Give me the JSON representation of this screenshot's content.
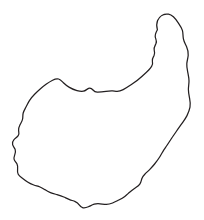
{
  "canvas": {
    "width": 204,
    "height": 220,
    "background_color": "#ffffff",
    "title": "Hand-drawn closed outline silhouette"
  },
  "drawing": {
    "name": "comma-shaped blob outline",
    "description": "Single closed hand-drawn contour: a rounded bumpy body filling the lower-left, rising into a narrow pointed hook at the upper right, with a concave notch along the top edge between the body and the hook.",
    "stroke_color": "#231f20",
    "fill_color": "none",
    "stroke_width": 1.25,
    "closed": true,
    "shape_type": "freeform-outline",
    "bounding_box": {
      "x": 12,
      "y": 13,
      "width": 179,
      "height": 196
    },
    "extrema": {
      "topmost": {
        "x": 168,
        "y": 14
      },
      "bottommost": {
        "x": 84,
        "y": 208
      },
      "leftmost": {
        "x": 12,
        "y": 141
      },
      "rightmost": {
        "x": 190,
        "y": 112
      }
    },
    "path_d": "M 168.5 14.2 C 163.6 13.4 159.4 16.2 157.6 20.6 C 156.2 24.0 156.6 26.8 157.4 29.8 C 155.8 32.6 154.6 35.0 155.4 37.6 C 156.2 40.0 157.0 41.4 156.0 43.6 C 154.8 46.2 153.6 47.6 154.2 50.0 C 154.8 52.2 155.2 53.6 154.0 55.8 C 152.8 58.0 151.8 59.0 152.4 61.2 C 152.9 63.2 153.0 64.2 151.6 66.4 C 149.0 70.4 145.4 73.2 142.4 76.0 C 138.8 79.4 135.2 82.0 131.4 84.6 C 128.6 86.5 126.0 88.2 123.2 89.6 C 121.0 90.7 119.0 91.3 117.2 91.3 C 115.6 91.3 114.2 91.0 112.6 90.9 C 110.4 90.8 108.2 91.0 106.0 91.4 C 103.0 91.9 100.0 92.3 97.2 92.2 C 95.2 92.1 94.0 91.2 93.0 90.0 C 91.8 88.6 90.4 87.6 88.6 88.4 C 86.8 89.2 85.4 90.8 83.4 91.2 C 81.4 91.6 79.2 91.2 77.0 90.6 C 74.4 89.9 71.8 88.8 69.4 87.4 C 67.2 86.1 65.2 84.6 63.4 82.8 C 61.8 81.2 60.6 79.6 58.6 79.0 C 56.6 78.4 54.6 79.2 52.6 80.2 C 50.4 81.3 48.4 82.6 46.4 84.0 C 44.2 85.6 42.2 87.2 40.2 88.9 C 38.2 90.6 36.4 92.4 34.6 94.2 C 32.6 96.2 31.0 98.2 29.6 100.4 C 28.2 102.6 27.2 104.8 26.0 107.0 C 24.9 109.1 23.8 110.8 23.2 113.0 C 22.6 115.2 23.0 117.0 22.6 119.0 C 22.2 121.2 21.0 122.8 20.0 124.8 C 19.0 126.8 18.2 128.6 18.6 130.8 C 19.0 132.8 19.4 133.8 18.2 135.6 C 17.0 137.4 15.2 138.2 14.0 139.6 C 12.6 141.2 12.0 142.6 12.6 144.6 C 13.2 146.6 14.6 147.8 15.2 149.6 C 15.8 151.4 15.4 152.8 14.8 154.6 C 14.2 156.4 13.6 157.8 14.2 159.6 C 14.8 161.4 16.2 162.4 17.0 164.0 C 17.8 165.6 17.8 167.0 17.6 168.8 C 17.4 170.8 17.2 172.4 18.2 174.2 C 19.2 176.0 20.8 177.0 22.4 178.2 C 24.2 179.6 25.8 180.8 27.6 182.0 C 29.6 183.3 31.6 184.2 33.8 185.0 C 36.0 185.8 38.0 186.2 40.0 187.0 C 41.8 187.7 43.2 188.6 44.8 189.6 C 46.6 190.8 48.4 191.8 50.4 192.6 C 52.6 193.5 54.8 194.0 57.0 194.6 C 59.4 195.3 61.6 196.0 63.8 197.0 C 65.8 197.9 67.6 198.8 69.6 199.6 C 71.6 200.4 73.4 200.8 75.2 201.6 C 77.0 202.4 78.2 203.4 79.2 204.8 C 80.2 206.2 81.2 207.4 83.0 207.8 C 84.8 208.2 86.6 207.6 88.4 206.8 C 90.4 205.9 92.2 204.8 94.2 204.2 C 96.2 203.6 98.0 203.6 100.0 203.8 C 102.2 204.0 104.2 204.4 106.4 204.4 C 108.6 204.4 110.6 203.8 112.6 203.0 C 114.8 202.1 116.8 201.0 118.8 200.0 C 121.0 198.9 123.0 197.8 124.8 196.4 C 126.6 195.0 128.0 193.6 129.6 192.2 C 131.4 190.6 133.0 189.4 134.8 188.2 C 136.8 186.9 138.6 186.0 139.8 184.2 C 141.0 182.4 141.2 180.6 141.8 178.8 C 142.4 177.0 143.4 175.6 144.8 174.2 C 146.4 172.6 148.0 171.2 149.6 169.6 C 151.4 167.8 153.0 166.0 154.6 164.0 C 156.2 162.0 157.6 160.2 159.0 158.0 C 160.4 155.8 161.6 153.6 163.0 151.4 C 164.4 149.2 165.8 147.2 167.2 145.0 C 168.8 142.6 170.2 140.4 171.8 138.0 C 173.4 135.6 175.0 133.4 176.6 131.0 C 178.4 128.4 180.2 126.0 182.0 123.4 C 183.8 120.8 185.6 118.4 187.0 115.6 C 188.4 112.8 189.4 110.2 190.0 107.2 C 190.6 104.2 190.2 101.4 189.6 98.4 C 189.0 95.4 188.4 92.6 188.4 89.6 C 188.4 86.6 189.0 84.0 189.0 81.0 C 189.0 78.0 188.4 75.4 187.8 72.4 C 187.2 69.4 186.6 66.8 186.8 63.8 C 187.0 60.8 188.0 58.2 188.2 55.2 C 188.4 52.2 187.8 49.6 186.6 46.8 C 185.4 44.0 184.0 41.8 183.4 38.8 C 182.8 35.8 183.2 33.2 182.4 30.4 C 181.6 27.6 180.0 25.6 178.4 23.2 C 176.8 20.8 175.4 18.6 173.4 16.8 C 171.8 15.4 170.4 14.5 168.5 14.2 Z"
  }
}
